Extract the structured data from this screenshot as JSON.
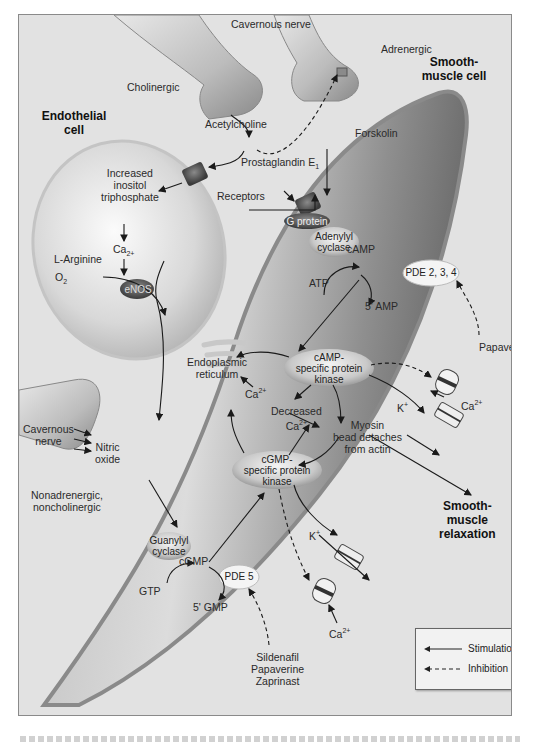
{
  "cells": {
    "endothelial": "Endothelial cell",
    "smooth_muscle": "Smooth-muscle cell"
  },
  "nerves": {
    "cavernous_top": "Cavernous nerve",
    "cholinergic": "Cholinergic",
    "adrenergic": "Adrenergic",
    "cavernous_left_1": "Cavernous",
    "cavernous_left_2": "nerve",
    "nanc_1": "Nonadrenergic,",
    "nanc_2": "noncholinergic"
  },
  "molecules": {
    "acetylcholine": "Acetylcholine",
    "receptors": "Receptors",
    "prostaglandin": "Prostaglandin E",
    "prostaglandin_sub": "1",
    "forskolin": "Forskolin",
    "ip3_1": "Increased",
    "ip3_2": "inositol",
    "ip3_3": "triphosphate",
    "ca_endo": "Ca",
    "ca_endo_sub": "2+",
    "l_arginine": "L-Arginine",
    "o2": "O",
    "o2_sub": "2",
    "enos": "eNOS",
    "nitric_1": "Nitric",
    "nitric_2": "oxide",
    "g_protein": "G protein",
    "adenylyl_1": "Adenylyl",
    "adenylyl_2": "cyclase",
    "atp": "ATP",
    "camp": "cAMP",
    "pde234": "PDE 2, 3, 4",
    "amp5": "5' AMP",
    "papaverine": "Papaverine",
    "camp_kinase_1": "cAMP-",
    "camp_kinase_2": "specific protein",
    "camp_kinase_3": "kinase",
    "er_1": "Endoplasmic",
    "er_2": "reticulum",
    "ca2": "Ca",
    "ca2_sup": "2+",
    "decreased": "Decreased",
    "myosin_1": "Myosin",
    "myosin_2": "head detaches",
    "myosin_3": "from actin",
    "k_plus": "K",
    "k_sup": "+",
    "cgmp_kinase_1": "cGMP-",
    "cgmp_kinase_2": "specific protein",
    "cgmp_kinase_3": "kinase",
    "guanylyl_1": "Guanylyl",
    "guanylyl_2": "cyclase",
    "gtp": "GTP",
    "cgmp": "cGMP",
    "pde5": "PDE 5",
    "gmp5": "5' GMP",
    "inhibitors_1": "Sildenafil",
    "inhibitors_2": "Papaverine",
    "inhibitors_3": "Zaprinast"
  },
  "outcome": {
    "line1": "Smooth-",
    "line2": "muscle",
    "line3": "relaxation"
  },
  "legend": {
    "stimulation": "Stimulation",
    "inhibition": "Inhibition"
  },
  "colors": {
    "background": "#e2e2e2",
    "cell_dark": "#7a7a7a",
    "cell_light": "#f4f4f4",
    "arrow": "#1a1a1a"
  }
}
